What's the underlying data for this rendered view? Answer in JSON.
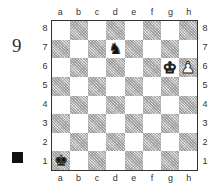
{
  "diagram": {
    "number": "9",
    "side_to_move": "black",
    "side_marker_color": "#111111"
  },
  "board": {
    "files": [
      "a",
      "b",
      "c",
      "d",
      "e",
      "f",
      "g",
      "h"
    ],
    "ranks": [
      "8",
      "7",
      "6",
      "5",
      "4",
      "3",
      "2",
      "1"
    ],
    "light_square_color": "#ffffff",
    "dark_square_pattern": "gray-hatched",
    "pieces": [
      {
        "square": "d7",
        "color": "black",
        "type": "knight",
        "glyph": "♞"
      },
      {
        "square": "g6",
        "color": "white",
        "type": "king",
        "glyph": "♚"
      },
      {
        "square": "h6",
        "color": "white",
        "type": "pawn",
        "glyph": "♟"
      },
      {
        "square": "a1",
        "color": "black",
        "type": "king",
        "glyph": "♚"
      }
    ]
  }
}
